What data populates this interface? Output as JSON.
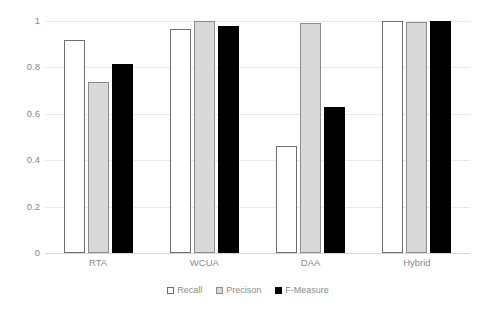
{
  "chart_data": {
    "type": "bar",
    "title": "",
    "xlabel": "",
    "ylabel": "",
    "categories": [
      "RTA",
      "WCUA",
      "DAA",
      "Hybrid"
    ],
    "series": [
      {
        "name": "Recall",
        "key": "recall",
        "color": "#ffffff",
        "border": "#6e6e6e",
        "values": [
          0.92,
          0.965,
          0.46,
          1.0
        ]
      },
      {
        "name": "Precison",
        "key": "precision",
        "color": "#d9d9d9",
        "border": "#8c8c8c",
        "values": [
          0.735,
          1.0,
          0.99,
          0.995
        ]
      },
      {
        "name": "F-Measure",
        "key": "fmeasure",
        "color": "#000000",
        "border": "#000000",
        "values": [
          0.815,
          0.98,
          0.63,
          0.998
        ]
      }
    ],
    "ylim": [
      0,
      1
    ],
    "yticks": [
      0,
      0.2,
      0.4,
      0.6,
      0.8,
      1
    ],
    "ytick_labels": [
      "0",
      "0.2",
      "0.4",
      "0.6",
      "0.8",
      "1"
    ],
    "grid": true,
    "legend_position": "bottom",
    "axis_text_color": "#8a8a8a",
    "gridline_color": "#e8e8e8"
  },
  "legend": {
    "items": [
      {
        "label": "Recall",
        "key": "recall"
      },
      {
        "label": "Precison",
        "key": "precision"
      },
      {
        "label": "F-Measure",
        "key": "fmeasure"
      }
    ]
  }
}
